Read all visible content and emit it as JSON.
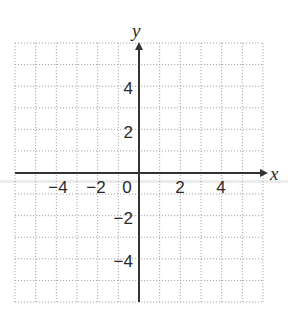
{
  "diagram": {
    "type": "coordinate-plane",
    "axes": {
      "x_label": "x",
      "y_label": "y"
    },
    "grid": {
      "x_min": -6,
      "x_max": 6,
      "y_min": -6,
      "y_max": 6,
      "step": 1,
      "style": "dotted"
    },
    "x_ticks": [
      {
        "value": -4,
        "label": "−4"
      },
      {
        "value": -2,
        "label": "−2"
      },
      {
        "value": 0,
        "label": "0"
      },
      {
        "value": 2,
        "label": "2"
      },
      {
        "value": 4,
        "label": "4"
      }
    ],
    "y_ticks": [
      {
        "value": 4,
        "label": "4"
      },
      {
        "value": 2,
        "label": "2"
      },
      {
        "value": -2,
        "label": "−2"
      },
      {
        "value": -4,
        "label": "−4"
      }
    ],
    "colors": {
      "axis": "#333333",
      "grid": "#a8a8a8",
      "background": "#ffffff",
      "band": "#e4e4e4"
    }
  }
}
